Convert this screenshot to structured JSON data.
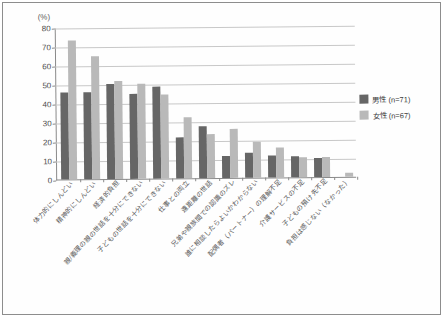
{
  "axis_unit": "(%)",
  "legend": {
    "position": "right",
    "entries": [
      {
        "label": "男性 (n=71)",
        "color": "#666666",
        "icon": "square-swatch"
      },
      {
        "label": "女性 (n=67)",
        "color": "#b9b9b9",
        "icon": "square-swatch"
      }
    ]
  },
  "chart_data": {
    "type": "bar",
    "title": "",
    "subtitle": "",
    "xlabel": "",
    "ylabel": "(%)",
    "ylim": [
      0,
      80
    ],
    "yticks": [
      0,
      10,
      20,
      30,
      40,
      50,
      60,
      70,
      80
    ],
    "ytick_labels": [
      "0",
      "10",
      "20",
      "30",
      "40",
      "50",
      "60",
      "70",
      "80"
    ],
    "grid": true,
    "legend_position": "right",
    "categories": [
      "体力的にしんどい",
      "精神的にしんどい",
      "経済的負担",
      "親/義理の親の世話を十分にできない",
      "子どもの世話を十分にできない",
      "仕事との両立",
      "遠距離の世話",
      "兄弟や親族間での認識のズレ",
      "誰に相談したらよいかわからない",
      "配偶者（パートナー）の理解不足",
      "介護サービスの不足",
      "子どもの預け先不足",
      "負担は感じない（なかった）"
    ],
    "series": [
      {
        "name": "男性 (n=71)",
        "color": "#666666",
        "values": [
          46,
          46,
          50,
          44.5,
          48.5,
          21.5,
          27.5,
          11.5,
          13,
          11.5,
          11,
          10,
          0
        ]
      },
      {
        "name": "女性 (n=67)",
        "color": "#b9b9b9",
        "values": [
          73,
          65,
          51.5,
          50,
          44,
          32,
          23,
          26,
          19,
          16,
          10.5,
          10.5,
          2
        ]
      }
    ]
  }
}
